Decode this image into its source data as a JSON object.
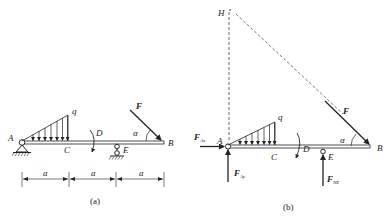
{
  "figure_a": {
    "caption": "(a)",
    "labels": {
      "A": "A",
      "B": "B",
      "C": "C",
      "D": "D",
      "E": "E",
      "q": "q",
      "F": "F",
      "alpha": "α"
    },
    "dimensions": [
      "a",
      "a",
      "a"
    ]
  },
  "figure_b": {
    "caption": "(b)",
    "labels": {
      "H": "H",
      "A": "A",
      "B": "B",
      "C": "C",
      "D": "D",
      "E": "E",
      "q": "q",
      "F": "F",
      "alpha": "α"
    },
    "forces": {
      "FAx": {
        "main": "F",
        "sub": "Ax"
      },
      "FAy": {
        "main": "F",
        "sub": "Ay"
      },
      "FNE": {
        "main": "F",
        "sub": "NE"
      }
    }
  },
  "colors": {
    "ink": "#222222",
    "background": "#ffffff"
  }
}
